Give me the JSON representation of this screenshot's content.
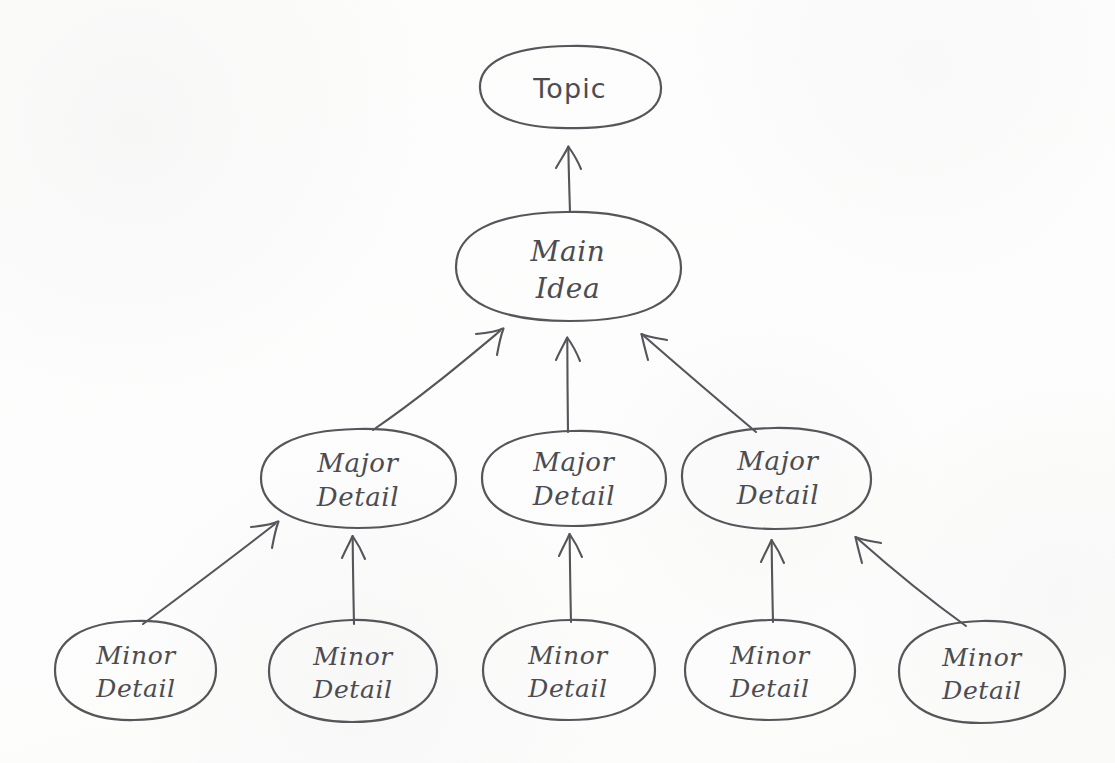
{
  "diagram": {
    "type": "concept-map",
    "style": "hand-drawn",
    "ink_color": "#55555a",
    "paper_color": "#fdfdfc",
    "levels": [
      "Topic",
      "Main Idea",
      "Major Detail",
      "Minor Detail"
    ],
    "nodes": [
      {
        "id": "topic",
        "label": "Topic",
        "label_line1": "Topic",
        "label_line2": "",
        "level": 0,
        "cx": 570,
        "cy": 87,
        "rx": 90,
        "ry": 41
      },
      {
        "id": "main",
        "label": "Main Idea",
        "label_line1": "Main",
        "label_line2": "Idea",
        "level": 1,
        "cx": 568,
        "cy": 266,
        "rx": 113,
        "ry": 55
      },
      {
        "id": "major1",
        "label": "Major Detail",
        "label_line1": "Major",
        "label_line2": "Detail",
        "level": 2,
        "cx": 358,
        "cy": 478,
        "rx": 98,
        "ry": 50
      },
      {
        "id": "major2",
        "label": "Major Detail",
        "label_line1": "Major",
        "label_line2": "Detail",
        "level": 2,
        "cx": 574,
        "cy": 478,
        "rx": 92,
        "ry": 48
      },
      {
        "id": "major3",
        "label": "Major Detail",
        "label_line1": "Major",
        "label_line2": "Detail",
        "level": 2,
        "cx": 777,
        "cy": 478,
        "rx": 95,
        "ry": 51
      },
      {
        "id": "minor1",
        "label": "Minor Detail",
        "label_line1": "Minor",
        "label_line2": "Detail",
        "level": 3,
        "cx": 135,
        "cy": 670,
        "rx": 81,
        "ry": 50
      },
      {
        "id": "minor2",
        "label": "Minor Detail",
        "label_line1": "Minor",
        "label_line2": "Detail",
        "level": 3,
        "cx": 353,
        "cy": 671,
        "rx": 84,
        "ry": 51
      },
      {
        "id": "minor3",
        "label": "Minor Detail",
        "label_line1": "Minor",
        "label_line2": "Detail",
        "level": 3,
        "cx": 569,
        "cy": 670,
        "rx": 86,
        "ry": 50
      },
      {
        "id": "minor4",
        "label": "Minor Detail",
        "label_line1": "Minor",
        "label_line2": "Detail",
        "level": 3,
        "cx": 770,
        "cy": 670,
        "rx": 85,
        "ry": 50
      },
      {
        "id": "minor5",
        "label": "Minor Detail",
        "label_line1": "Minor",
        "label_line2": "Detail",
        "level": 3,
        "cx": 982,
        "cy": 672,
        "rx": 83,
        "ry": 51
      }
    ],
    "edges": [
      {
        "from": "main",
        "to": "topic",
        "kind": "arrow-up"
      },
      {
        "from": "major1",
        "to": "main",
        "kind": "arrow-up-right"
      },
      {
        "from": "major2",
        "to": "main",
        "kind": "arrow-up"
      },
      {
        "from": "major3",
        "to": "main",
        "kind": "arrow-up-left"
      },
      {
        "from": "minor1",
        "to": "major1",
        "kind": "arrow-up-right"
      },
      {
        "from": "minor2",
        "to": "major1",
        "kind": "arrow-up"
      },
      {
        "from": "minor3",
        "to": "major2",
        "kind": "arrow-up"
      },
      {
        "from": "minor4",
        "to": "major3",
        "kind": "arrow-up"
      },
      {
        "from": "minor5",
        "to": "major3",
        "kind": "arrow-up-left"
      }
    ]
  }
}
